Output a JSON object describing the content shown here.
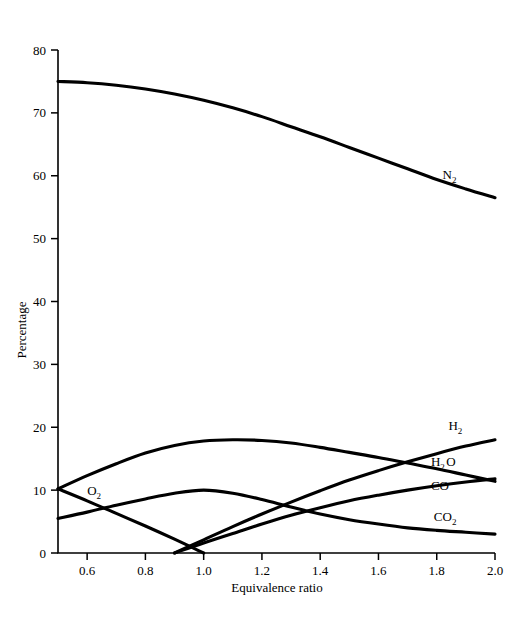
{
  "chart_data": {
    "type": "line",
    "title": "",
    "subtitle": "",
    "xlabel": "Equivalence ratio",
    "ylabel": "Percentage",
    "xlim": [
      0.5,
      2.0
    ],
    "ylim": [
      0,
      80
    ],
    "xticks": [
      0.6,
      0.8,
      1.0,
      1.2,
      1.4,
      1.6,
      1.8,
      2.0
    ],
    "xtick_labels": [
      "0.6",
      "0.8",
      "1.0",
      "1.2",
      "1.4",
      "1.6",
      "1.8",
      "2.0"
    ],
    "yticks": [
      0,
      10,
      20,
      30,
      40,
      50,
      60,
      70,
      80
    ],
    "ytick_labels": [
      "0",
      "10",
      "20",
      "30",
      "40",
      "50",
      "60",
      "70",
      "80"
    ],
    "grid": false,
    "legend_position": "inline-right-annotations",
    "x": [
      0.5,
      0.6,
      0.7,
      0.8,
      0.9,
      1.0,
      1.1,
      1.2,
      1.3,
      1.4,
      1.5,
      1.6,
      1.7,
      1.8,
      1.9,
      2.0
    ],
    "series": [
      {
        "name": "N2",
        "label": "N",
        "label_sub": "2",
        "label_x": 1.82,
        "label_y": 59.5,
        "values": [
          75.0,
          74.8,
          74.4,
          73.8,
          73.0,
          72.0,
          70.8,
          69.4,
          67.8,
          66.2,
          64.5,
          62.8,
          61.1,
          59.4,
          57.9,
          56.5
        ]
      },
      {
        "name": "H2O",
        "label": "H",
        "label_sub": "2",
        "label_tail": "O",
        "label_x": 1.78,
        "label_y": 13.8,
        "values": [
          10.2,
          12.3,
          14.2,
          15.9,
          17.1,
          17.8,
          18.0,
          17.9,
          17.5,
          16.8,
          16.0,
          15.2,
          14.3,
          13.4,
          12.4,
          11.4
        ]
      },
      {
        "name": "O2",
        "label": "O",
        "label_sub": "2",
        "label_x": 0.6,
        "label_y": 9.2,
        "values": [
          10.2,
          8.3,
          6.3,
          4.3,
          2.2,
          0.0,
          null,
          null,
          null,
          null,
          null,
          null,
          null,
          null,
          null,
          null
        ]
      },
      {
        "name": "H2",
        "label": "H",
        "label_sub": "2",
        "label_x": 1.84,
        "label_y": 19.6,
        "values": [
          null,
          null,
          null,
          null,
          0.0,
          2.1,
          4.2,
          6.2,
          8.1,
          9.9,
          11.6,
          13.1,
          14.5,
          15.8,
          17.0,
          18.0
        ]
      },
      {
        "name": "CO",
        "label": "CO",
        "label_x": 1.78,
        "label_y": 10.0,
        "values": [
          null,
          null,
          null,
          null,
          0.0,
          1.6,
          3.1,
          4.6,
          6.0,
          7.2,
          8.3,
          9.2,
          10.0,
          10.7,
          11.3,
          11.8
        ]
      },
      {
        "name": "CO2",
        "label": "CO",
        "label_sub": "2",
        "label_x": 1.79,
        "label_y": 5.1,
        "values": [
          5.5,
          6.5,
          7.6,
          8.6,
          9.5,
          10.0,
          9.5,
          8.5,
          7.3,
          6.2,
          5.3,
          4.6,
          4.0,
          3.6,
          3.3,
          3.0
        ]
      }
    ]
  }
}
